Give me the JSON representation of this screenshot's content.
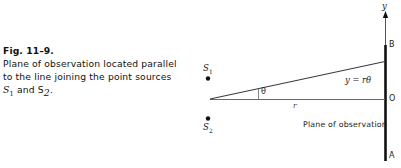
{
  "figure": {
    "number_label": "Fig. 11–9.",
    "caption_lines": [
      "Plane of observation located parallel",
      "to the line joining the point sources"
    ],
    "caption_last_line_prefix": "S",
    "caption_last_line_sub1": "1",
    "caption_last_line_mid": " and S",
    "caption_last_line_sub2": "2",
    "caption_last_line_end": "."
  },
  "diagram": {
    "axis_label_y": "y",
    "point_b_label": "B",
    "point_o_label": "O",
    "point_a_label": "A",
    "source1_label": "S",
    "source1_sub": "1",
    "source2_label": "S",
    "source2_sub": "2",
    "angle_label": "θ",
    "radius_label": "r",
    "equation_label": "y = rθ",
    "plane_label": "Plane of observation",
    "colors": {
      "ink": "#111111",
      "line": "#555555",
      "thick_line": "#111111",
      "background": "#ffffff"
    }
  }
}
